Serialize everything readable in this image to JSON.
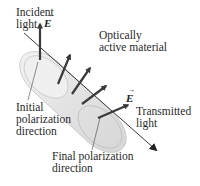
{
  "diagram": {
    "labels": {
      "incident_light": [
        "Incident",
        "light"
      ],
      "optically_active_material": [
        "Optically",
        "active material"
      ],
      "initial_polarization": [
        "Initial",
        "polarization",
        "direction"
      ],
      "transmitted_light": [
        "Transmitted",
        "light"
      ],
      "final_polarization": [
        "Final polarization",
        "direction"
      ],
      "e_field_symbol": "E",
      "vector_arrow": "→"
    },
    "field_arrows": {
      "count_inside_material": 4,
      "rotation": "progressively rotates from vertical toward horizontal along propagation"
    },
    "colors": {
      "cylinder_fill": "#e4e4e4",
      "cylinder_edge": "#c4c4c4",
      "arrow": "#3a3a3a",
      "text": "#2a2a2a",
      "beam": "#222222"
    }
  }
}
